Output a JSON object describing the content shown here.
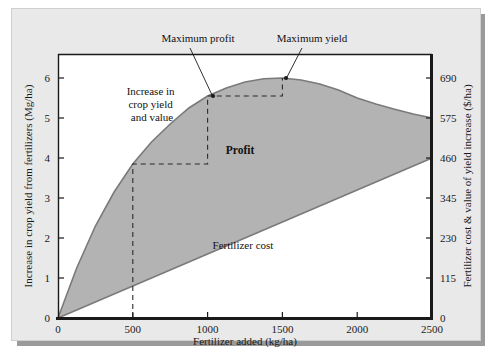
{
  "figure": {
    "background_color": "#e9e9e9",
    "plot_background_color": "#ffffff",
    "fill_color": "#b3b3b3",
    "axis_color": "#1a1a1a"
  },
  "chart_data": {
    "type": "area",
    "title": "",
    "xlabel": "Fertilizer added (kg/ha)",
    "ylabel": "Increase in crop yield from fertilizers (Mg/ha)",
    "y2label": "Fertilizer cost & value of yield increase ($/ha)",
    "xlim": [
      0,
      2500
    ],
    "ylim": [
      0,
      6.6
    ],
    "y2lim": [
      0,
      759
    ],
    "grid": false,
    "legend": "none",
    "xticks": [
      0,
      500,
      1000,
      1500,
      2000,
      2500
    ],
    "xtick_labels": [
      "0",
      "500",
      "1000",
      "1500",
      "2000",
      "2500"
    ],
    "yticks": [
      0,
      1,
      2,
      3,
      4,
      5,
      6
    ],
    "ytick_labels": [
      "0",
      "1",
      "2",
      "3",
      "4",
      "5",
      "6"
    ],
    "y2ticks": [
      0,
      115,
      230,
      345,
      460,
      575,
      690
    ],
    "y2tick_labels": [
      "0",
      "115",
      "230",
      "345",
      "460",
      "575",
      "690"
    ],
    "series": [
      {
        "name": "Increase in crop yield and value",
        "type": "line",
        "x": [
          0,
          125,
          250,
          375,
          500,
          625,
          750,
          875,
          1000,
          1125,
          1250,
          1375,
          1500,
          1625,
          1750,
          1875,
          2000,
          2125,
          2250,
          2375,
          2500
        ],
        "values": [
          0,
          1.25,
          2.3,
          3.15,
          3.85,
          4.4,
          4.85,
          5.25,
          5.55,
          5.75,
          5.9,
          5.98,
          6.0,
          5.95,
          5.85,
          5.7,
          5.5,
          5.35,
          5.22,
          5.1,
          5.0
        ]
      },
      {
        "name": "Fertilizer cost",
        "type": "line",
        "x": [
          0,
          2500
        ],
        "values": [
          0,
          4.0
        ]
      }
    ],
    "annotations": [
      {
        "name": "maximum-profit",
        "label": "Maximum profit",
        "x": 1000,
        "y": 5.55
      },
      {
        "name": "maximum-yield",
        "label": "Maximum yield",
        "x": 1500,
        "y": 6.0
      },
      {
        "name": "increase-in-crop-yield-and-value",
        "label_lines": [
          "Increase in",
          "crop yield",
          "and value"
        ]
      },
      {
        "name": "profit",
        "label": "Profit"
      },
      {
        "name": "fertilizer-cost",
        "label": "Fertilizer cost"
      }
    ],
    "construction_steps": [
      {
        "x": 500,
        "y": 3.85
      },
      {
        "x": 1000,
        "y": 5.55
      },
      {
        "x": 1500,
        "y": 6.0
      }
    ]
  }
}
